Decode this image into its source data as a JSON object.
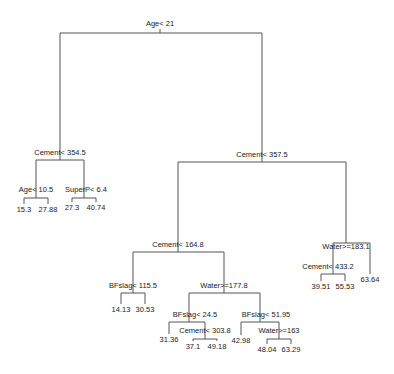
{
  "colors": {
    "line": "#555555",
    "text": "#222222",
    "background": "#ffffff"
  },
  "nodes": {
    "root": {
      "label": "Age< 21",
      "x": 160,
      "y": 33,
      "lx": 160,
      "ly": 26,
      "left": "n_l",
      "right": "n_r"
    },
    "n_l": {
      "label": "Cement< 354.5",
      "x": 60,
      "y": 160,
      "lx": 60,
      "ly": 155,
      "left": "n_ll",
      "right": "n_lr"
    },
    "n_ll": {
      "label": "Age< 10.5",
      "x": 36,
      "y": 198,
      "lx": 36,
      "ly": 192,
      "left": "leaf_1",
      "right": "leaf_2"
    },
    "n_lr": {
      "label": "SuperP< 6.4",
      "x": 84,
      "y": 198,
      "lx": 86,
      "ly": 192,
      "left": "leaf_3",
      "right": "leaf_4"
    },
    "n_r": {
      "label": "Cement< 357.5",
      "x": 262,
      "y": 162,
      "lx": 262,
      "ly": 157,
      "left": "n_rl",
      "right": "n_rr"
    },
    "n_rl": {
      "label": "Cement< 164.8",
      "x": 178,
      "y": 252,
      "lx": 178,
      "ly": 247,
      "left": "n_rll",
      "right": "n_rlr"
    },
    "n_rll": {
      "label": "BFslag< 115.5",
      "x": 133,
      "y": 293,
      "lx": 133,
      "ly": 288,
      "left": "leaf_5",
      "right": "leaf_6"
    },
    "n_rlr": {
      "label": "Water>=177.8",
      "x": 224,
      "y": 293,
      "lx": 224,
      "ly": 288,
      "left": "n_rlrl",
      "right": "n_rlrr"
    },
    "n_rlrl": {
      "label": "BFslag< 24.5",
      "x": 189,
      "y": 322,
      "lx": 195,
      "ly": 317,
      "left": "leaf_7",
      "right": "n_rlrlr"
    },
    "n_rlrlr": {
      "label": "Cement< 303.8",
      "x": 205,
      "y": 339,
      "lx": 205,
      "ly": 333,
      "left": "leaf_8",
      "right": "leaf_9"
    },
    "n_rlrr": {
      "label": "BFslag< 51.95",
      "x": 260,
      "y": 322,
      "lx": 266,
      "ly": 317,
      "left": "leaf_10",
      "right": "n_rlrrr"
    },
    "n_rlrrr": {
      "label": "Water>=163",
      "x": 279,
      "y": 339,
      "lx": 279,
      "ly": 333,
      "left": "leaf_11",
      "right": "leaf_12"
    },
    "n_rr": {
      "label": "Water>=183.1",
      "x": 346,
      "y": 243,
      "lx": 346,
      "ly": 249,
      "left": "n_rrl",
      "right": "leaf_15"
    },
    "n_rrl": {
      "label": "Cement< 433.2",
      "x": 333,
      "y": 274,
      "lx": 328,
      "ly": 269,
      "left": "leaf_13",
      "right": "leaf_14"
    }
  },
  "leaves": {
    "leaf_1": {
      "value": "15.3",
      "x": 24,
      "y": 212
    },
    "leaf_2": {
      "value": "27.88",
      "x": 48,
      "y": 212
    },
    "leaf_3": {
      "value": "27.3",
      "x": 72,
      "y": 210
    },
    "leaf_4": {
      "value": "40.74",
      "x": 96,
      "y": 210
    },
    "leaf_5": {
      "value": "14.13",
      "x": 121,
      "y": 312
    },
    "leaf_6": {
      "value": "30.53",
      "x": 145,
      "y": 312
    },
    "leaf_7": {
      "value": "31.36",
      "x": 169,
      "y": 342
    },
    "leaf_8": {
      "value": "37.1",
      "x": 193,
      "y": 349
    },
    "leaf_9": {
      "value": "49.18",
      "x": 217,
      "y": 349
    },
    "leaf_10": {
      "value": "42.98",
      "x": 241,
      "y": 343
    },
    "leaf_11": {
      "value": "48.04",
      "x": 267,
      "y": 352
    },
    "leaf_12": {
      "value": "63.29",
      "x": 291,
      "y": 352
    },
    "leaf_13": {
      "value": "39.51",
      "x": 321,
      "y": 289
    },
    "leaf_14": {
      "value": "55.53",
      "x": 345,
      "y": 289
    },
    "leaf_15": {
      "value": "63.64",
      "x": 370,
      "y": 282
    }
  }
}
